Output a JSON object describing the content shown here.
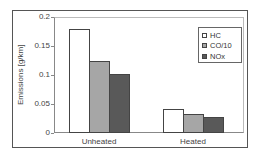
{
  "chart_data": {
    "type": "bar",
    "title": "",
    "xlabel": "",
    "ylabel": "Emissions [g/km]",
    "ylim": [
      0,
      0.2
    ],
    "yticks": [
      "0",
      "0.05",
      "0.1",
      "0.15",
      "0.2"
    ],
    "categories": [
      "Unheated",
      "Heated"
    ],
    "series": [
      {
        "name": "HC",
        "color": "#ffffff",
        "values": [
          0.18,
          0.042
        ]
      },
      {
        "name": "CO/10",
        "color": "#a6a6a6",
        "values": [
          0.125,
          0.032
        ]
      },
      {
        "name": "NOx",
        "color": "#595959",
        "values": [
          0.102,
          0.028
        ]
      }
    ],
    "legend_position": "upper right",
    "grid": false
  }
}
